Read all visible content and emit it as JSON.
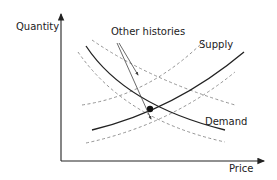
{
  "diagram": {
    "type": "supply-demand",
    "axes": {
      "y_label": "Quantity",
      "x_label": "Price"
    },
    "curves": {
      "supply_label": "Supply",
      "demand_label": "Demand",
      "alternatives_label": "Other histories"
    },
    "equilibrium": {
      "marker": "filled-dot"
    },
    "colors": {
      "solid_line": "#222222",
      "dashed_line": "#888888",
      "background": "#ffffff"
    }
  }
}
